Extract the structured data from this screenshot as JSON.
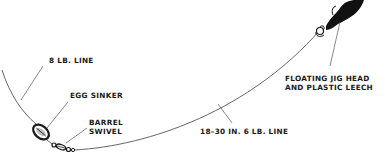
{
  "diagram": {
    "type": "fishing-rig",
    "colors": {
      "line": "#555555",
      "ink": "#1a1a1a",
      "background": "#ffffff"
    },
    "labels": {
      "main_line": "8 LB. LINE",
      "egg_sinker": "EGG SINKER",
      "barrel_swivel_1": "BARREL",
      "barrel_swivel_2": "SWIVEL",
      "leader": "18–30 IN. 6 LB. LINE",
      "jig_1": "FLOATING JIG HEAD",
      "jig_2": "AND PLASTIC LEECH"
    },
    "components": [
      {
        "id": "main-line",
        "label": "8 LB. LINE"
      },
      {
        "id": "egg-sinker",
        "label": "EGG SINKER"
      },
      {
        "id": "barrel-swivel",
        "label": "BARREL SWIVEL"
      },
      {
        "id": "leader-line",
        "label": "18–30 IN. 6 LB. LINE"
      },
      {
        "id": "jig-and-leech",
        "label": "FLOATING JIG HEAD AND PLASTIC LEECH"
      }
    ]
  }
}
